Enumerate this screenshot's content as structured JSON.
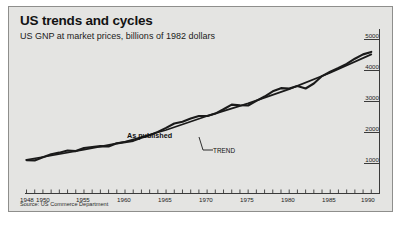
{
  "figure": {
    "title": "US trends and cycles",
    "subtitle": "US GNP at market prices, billions of 1982 dollars",
    "source": "Source: US Commerce Department",
    "panel_bg": "#e4e4e2",
    "line_color": "#1a1a1a"
  },
  "annotations": {
    "published": "As published",
    "trend": "TREND"
  },
  "chart_data": {
    "type": "line",
    "title": "US trends and cycles",
    "subtitle": "US GNP at market prices, billions of 1982 dollars",
    "xlabel": "",
    "ylabel": "billions of 1982 dollars",
    "grid": false,
    "legend": "inline-annotations",
    "y_axis_position": "right",
    "xlim": [
      1948,
      1991
    ],
    "ylim": [
      700,
      5000
    ],
    "yticks": [
      1000,
      2000,
      3000,
      4000,
      5000
    ],
    "ytick_labels": [
      "1000",
      "2000",
      "3000",
      "4000",
      "5000"
    ],
    "xticks": [
      1948,
      1950,
      1955,
      1960,
      1965,
      1970,
      1975,
      1980,
      1985,
      1990
    ],
    "xtick_labels": [
      "1948",
      "1950",
      "1955",
      "1960",
      "1965",
      "1970",
      "1975",
      "1980",
      "1985",
      "1990"
    ],
    "x_minor_tick_interval": 1,
    "series": [
      {
        "name": "As published",
        "x": [
          1948,
          1949,
          1950,
          1951,
          1952,
          1953,
          1954,
          1955,
          1956,
          1957,
          1958,
          1959,
          1960,
          1961,
          1962,
          1963,
          1964,
          1965,
          1966,
          1967,
          1968,
          1969,
          1970,
          1971,
          1972,
          1973,
          1974,
          1975,
          1976,
          1977,
          1978,
          1979,
          1980,
          1981,
          1982,
          1983,
          1984,
          1985,
          1986,
          1987,
          1988,
          1989,
          1990
        ],
        "values": [
          1110,
          1100,
          1200,
          1300,
          1350,
          1420,
          1400,
          1500,
          1530,
          1560,
          1550,
          1650,
          1690,
          1730,
          1830,
          1910,
          2020,
          2150,
          2290,
          2350,
          2450,
          2530,
          2530,
          2610,
          2750,
          2900,
          2880,
          2870,
          3020,
          3160,
          3330,
          3430,
          3420,
          3500,
          3420,
          3580,
          3820,
          3960,
          4080,
          4210,
          4380,
          4520,
          4600
        ]
      },
      {
        "name": "TREND",
        "x": [
          1948,
          1950,
          1955,
          1960,
          1965,
          1970,
          1975,
          1980,
          1985,
          1990
        ],
        "values": [
          1120,
          1210,
          1450,
          1700,
          2080,
          2530,
          2940,
          3400,
          3930,
          4520
        ]
      }
    ]
  }
}
